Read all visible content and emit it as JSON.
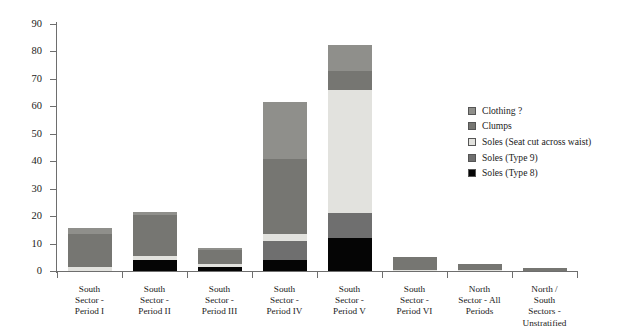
{
  "chart_data": {
    "type": "bar",
    "subtype": "stacked-vertical",
    "title": "",
    "xlabel": "",
    "ylabel": "",
    "ylim": [
      0,
      90
    ],
    "yticks": [
      0,
      10,
      20,
      30,
      40,
      50,
      60,
      70,
      80,
      90
    ],
    "grid": false,
    "legend_position": "right",
    "categories": [
      "South Sector - Period I",
      "South Sector - Period II",
      "South Sector - Period III",
      "South Sector - Period IV",
      "South Sector - Period V",
      "South Sector - Period VI",
      "North Sector - All Periods",
      "North / South Sectors - Unstratified"
    ],
    "category_labels": [
      [
        "South",
        "Sector -",
        "Period I"
      ],
      [
        "South",
        "Sector -",
        "Period II"
      ],
      [
        "South",
        "Sector -",
        "Period III"
      ],
      [
        "South",
        "Sector -",
        "Period IV"
      ],
      [
        "South",
        "Sector -",
        "Period V"
      ],
      [
        "South",
        "Sector -",
        "Period VI"
      ],
      [
        "North",
        "Sector - All",
        "Periods"
      ],
      [
        "North /",
        "South",
        "Sectors -",
        "Unstratified"
      ]
    ],
    "series": [
      {
        "name": "Soles (Type 8)",
        "color": "#050505",
        "values": [
          0,
          4,
          1.5,
          4,
          12,
          0,
          0,
          0
        ]
      },
      {
        "name": "Soles (Type 9)",
        "color": "#6f6f6f",
        "values": [
          0,
          0,
          0,
          7,
          9,
          0,
          0,
          0
        ]
      },
      {
        "name": "Soles (Seat cut across waist)",
        "color": "#e2e2de",
        "values": [
          1.5,
          1.5,
          1,
          2.5,
          45,
          0.5,
          0.3,
          0
        ]
      },
      {
        "name": "Clumps",
        "color": "#767672",
        "values": [
          12,
          15,
          5,
          27.5,
          7,
          4.5,
          2.2,
          1
        ]
      },
      {
        "name": "Clothing ?",
        "color": "#8f8f8b",
        "values": [
          2,
          1,
          1,
          20.5,
          9.5,
          0,
          0,
          0
        ]
      }
    ],
    "totals": [
      15.5,
      21.5,
      8.5,
      61.5,
      82.5,
      5,
      2.5,
      1
    ]
  },
  "legend": {
    "entries": [
      {
        "label": "Clothing ?",
        "color": "#8f8f8b"
      },
      {
        "label": "Clumps",
        "color": "#767672"
      },
      {
        "label": "Soles (Seat cut across waist)",
        "color": "#e2e2de"
      },
      {
        "label": "Soles (Type 9)",
        "color": "#6f6f6f"
      },
      {
        "label": "Soles (Type 8)",
        "color": "#050505"
      }
    ]
  },
  "axis": {
    "y_tick_labels": [
      "90",
      "80",
      "70",
      "60",
      "50",
      "40",
      "30",
      "20",
      "10",
      "0"
    ]
  }
}
